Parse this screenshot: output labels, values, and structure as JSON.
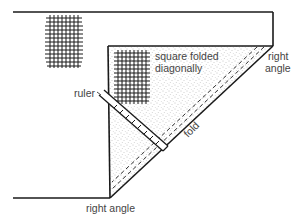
{
  "diagram": {
    "labels": {
      "square_folded_line1": "square folded",
      "square_folded_line2": "diagonally",
      "right_angle_top_line1": "right",
      "right_angle_top_line2": "angle",
      "ruler": "ruler",
      "fold": "fold",
      "right_angle_bottom": "right angle"
    },
    "colors": {
      "line": "#1a1a1a",
      "stipple": "#9a9a9a",
      "text": "#444444",
      "background": "#ffffff"
    },
    "elements": [
      "fabric outline",
      "weave grid (top-left)",
      "weave grid (inner square)",
      "folded triangle (stippled)",
      "fold line",
      "dashed cutting lines",
      "ruler with tick marks"
    ]
  }
}
